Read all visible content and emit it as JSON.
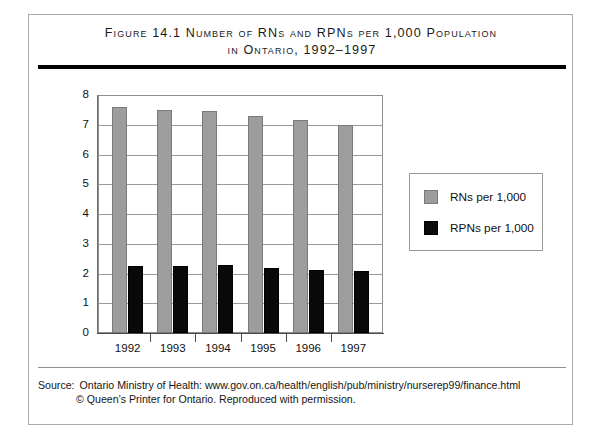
{
  "figure": {
    "title_line_1": "Figure 14.1  Number of RNs and RPNs per 1,000 Population",
    "title_line_2": "in Ontario, 1992–1997"
  },
  "source": {
    "label": "Source:",
    "line_1": "Ontario Ministry of Health: www.gov.on.ca/health/english/pub/ministry/nurserep99/finance.html",
    "line_2": "© Queen’s Printer for Ontario. Reproduced with permission."
  },
  "legend": {
    "position": "right",
    "items": [
      {
        "label": "RNs per 1,000",
        "color": "#9d9d9d"
      },
      {
        "label": "RPNs per 1,000",
        "color": "#0a0a0a"
      }
    ]
  },
  "axis": {
    "y_ticks": [
      "8",
      "7",
      "6",
      "5",
      "4",
      "3",
      "2",
      "1",
      "0"
    ],
    "x_ticks": [
      "1992",
      "1993",
      "1994",
      "1995",
      "1996",
      "1997"
    ]
  },
  "chart_data": {
    "type": "bar",
    "title": "Figure 14.1  Number of RNs and RPNs per 1,000 Population in Ontario, 1992–1997",
    "xlabel": "",
    "ylabel": "",
    "categories": [
      "1992",
      "1993",
      "1994",
      "1995",
      "1996",
      "1997"
    ],
    "series": [
      {
        "name": "RNs per 1,000",
        "color": "#9d9d9d",
        "values": [
          7.6,
          7.5,
          7.45,
          7.3,
          7.15,
          7.0
        ]
      },
      {
        "name": "RPNs per 1,000",
        "color": "#0a0a0a",
        "values": [
          2.25,
          2.25,
          2.3,
          2.2,
          2.12,
          2.07
        ]
      }
    ],
    "ylim": [
      0,
      8
    ],
    "ytick_step": 1,
    "grid": true,
    "legend": "right"
  },
  "colors": {
    "rn_bar": "#9d9d9d",
    "rpn_bar": "#0a0a0a",
    "gridline": "#9a9a9a",
    "frame": "#8d8d8d",
    "rule": "#000000"
  }
}
